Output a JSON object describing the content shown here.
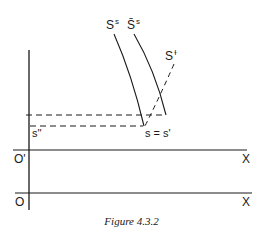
{
  "figure": {
    "caption": "Figure 4.3.2",
    "labels": {
      "curve_ss": {
        "base": "S",
        "sup": "s"
      },
      "curve_ss_bar": {
        "base": "S̄",
        "sup": "s"
      },
      "curve_sd": {
        "base": "S",
        "sup": "ɫ"
      },
      "s_double_prime": "s''",
      "s_eq_s_prime": "s = s'",
      "origin_prime": "O'",
      "origin": "O",
      "x_axis_upper": "X",
      "x_axis_lower": "X"
    },
    "colors": {
      "ink": "#1a1a1a",
      "background": "#ffffff"
    }
  }
}
